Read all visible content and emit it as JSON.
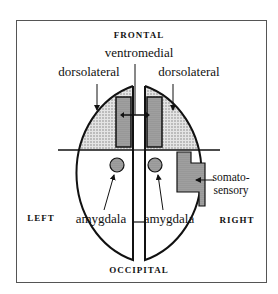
{
  "diagram": {
    "orientation_labels": {
      "top": "FRONTAL",
      "bottom": "OCCIPITAL",
      "left": "LEFT",
      "right": "RIGHT"
    },
    "regions": {
      "ventromedial": "ventromedial",
      "dorsolateral_left": "dorsolateral",
      "dorsolateral_right": "dorsolateral",
      "amygdala_left": "amygdala",
      "amygdala_right": "amygdala",
      "somatosensory_line1": "somato-",
      "somatosensory_line2": "sensory"
    },
    "colors": {
      "stipple_fill": "#cfcfcf",
      "dark_fill": "#9a9a9a",
      "outline": "#111111",
      "frame": "#555555"
    }
  }
}
